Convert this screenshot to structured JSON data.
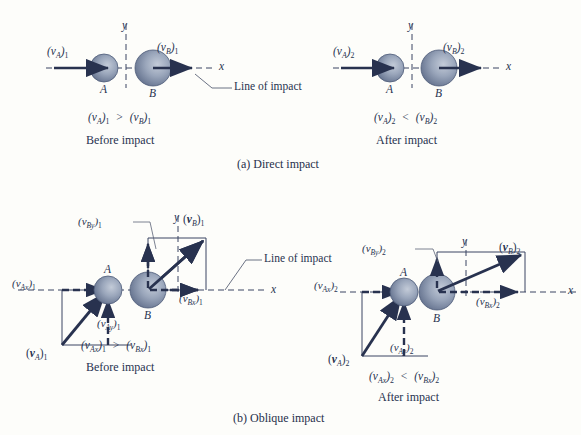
{
  "figure": {
    "background_color": "#fdfdfa",
    "ink_color": "#283350",
    "sphere_color_light": "#aab4c6",
    "sphere_color_dark": "#5c6b8a",
    "axis_color": "#3d4congress"
  },
  "panels": {
    "a": {
      "caption": "(a) Direct impact",
      "before": {
        "ball_a_label": "A",
        "ball_b_label": "B",
        "va_label": {
          "base": "(v",
          "sub": "A",
          "close": ")",
          "index": "1"
        },
        "vb_label": {
          "base": "(v",
          "sub": "B",
          "close": ")",
          "index": "1"
        },
        "x_axis_label": "x",
        "y_axis_label": "y",
        "line_of_impact_label": "Line of impact",
        "relation": {
          "left": "(v",
          "left_sub": "A",
          "left_idx": "1",
          "op": ">",
          "right": "(v",
          "right_sub": "B",
          "right_idx": "1"
        },
        "state_label": "Before impact"
      },
      "after": {
        "ball_a_label": "A",
        "ball_b_label": "B",
        "va_label": {
          "base": "(v",
          "sub": "A",
          "close": ")",
          "index": "2"
        },
        "vb_label": {
          "base": "(v",
          "sub": "B",
          "close": ")",
          "index": "2"
        },
        "x_axis_label": "x",
        "y_axis_label": "y",
        "relation": {
          "left": "(v",
          "left_sub": "A",
          "left_idx": "2",
          "op": "<",
          "right": "(v",
          "right_sub": "B",
          "right_idx": "2"
        },
        "state_label": "After impact"
      }
    },
    "b": {
      "caption": "(b) Oblique impact",
      "before": {
        "ball_a_label": "A",
        "ball_b_label": "B",
        "x_axis_label": "x",
        "y_axis_label": "y",
        "line_of_impact_label": "Line of impact",
        "vax_label": {
          "sub": "Ax",
          "index": "1"
        },
        "vay_label": {
          "sub": "Ay",
          "index": "1"
        },
        "va_vec_label": {
          "sub": "A",
          "index": "1"
        },
        "vbx_label": {
          "sub": "Bx",
          "index": "1"
        },
        "vby_label": {
          "sub": "By",
          "index": "1"
        },
        "vb_vec_label": {
          "sub": "B",
          "index": "1"
        },
        "relation": {
          "left_sub": "Ax",
          "left_idx": "1",
          "op": ">",
          "right_sub": "Bx",
          "right_idx": "1"
        },
        "state_label": "Before impact"
      },
      "after": {
        "ball_a_label": "A",
        "ball_b_label": "B",
        "x_axis_label": "x",
        "y_axis_label": "y",
        "vax_label": {
          "sub": "Ax",
          "index": "2"
        },
        "vay_label": {
          "sub": "Ay",
          "index": "2"
        },
        "va_vec_label": {
          "sub": "A",
          "index": "2"
        },
        "vbx_label": {
          "sub": "Bx",
          "index": "2"
        },
        "vby_label": {
          "sub": "By",
          "index": "2"
        },
        "vb_vec_label": {
          "sub": "B",
          "index": "2"
        },
        "relation": {
          "left_sub": "Ax",
          "left_idx": "2",
          "op": "<",
          "right_sub": "Bx",
          "right_idx": "2"
        },
        "state_label": "After impact"
      }
    }
  }
}
